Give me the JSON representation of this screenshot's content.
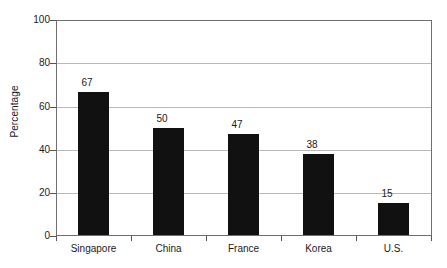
{
  "chart_data": {
    "type": "bar",
    "title": "",
    "subtitle": "",
    "xlabel": "",
    "ylabel": "Percentage",
    "categories": [
      "Singapore",
      "China",
      "France",
      "Korea",
      "U.S."
    ],
    "values": [
      67,
      50,
      47,
      38,
      15
    ],
    "value_labels": [
      "67",
      "50",
      "47",
      "38",
      "15"
    ],
    "ylim": [
      0,
      100
    ],
    "ytick_labels": [
      "0",
      "20",
      "40",
      "60",
      "80",
      "100"
    ],
    "ytick_values": [
      0,
      20,
      40,
      60,
      80,
      100
    ],
    "grid": "horizontal",
    "legend": "none",
    "series": [
      {
        "name": "Percentage",
        "values": [
          67,
          50,
          47,
          38,
          15
        ]
      }
    ],
    "colors": {
      "bar": "#111111",
      "gridline": "#b9b9b9",
      "axis": "#6e6e6e",
      "text": "#1a1a1a",
      "background": "#ffffff"
    }
  }
}
